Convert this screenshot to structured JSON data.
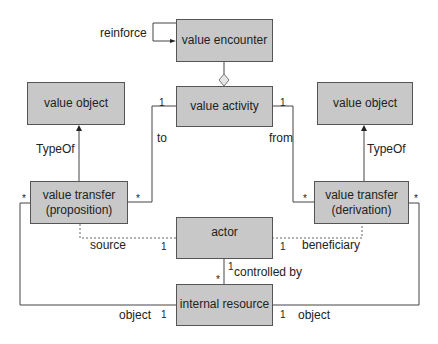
{
  "diagram": {
    "boxes": {
      "value_encounter": "value encounter",
      "value_activity": "value activity",
      "value_object_left": "value object",
      "value_object_right": "value object",
      "value_transfer_proposition_l1": "value transfer",
      "value_transfer_proposition_l2": "(proposition)",
      "value_transfer_derivation_l1": "value transfer",
      "value_transfer_derivation_l2": "(derivation)",
      "actor": "actor",
      "internal_resource": "internal resource"
    },
    "labels": {
      "reinforce": "reinforce",
      "to": "to",
      "from": "from",
      "typeof_left": "TypeOf",
      "typeof_right": "TypeOf",
      "source": "source",
      "beneficiary": "beneficiary",
      "controlled_by": "controlled by",
      "object_left": "object",
      "object_right": "object"
    },
    "multiplicities": {
      "activity_left": "1",
      "activity_right": "1",
      "proposition_left": "*",
      "proposition_right": "*",
      "derivation_left": "*",
      "derivation_right": "*",
      "actor_left": "1",
      "actor_right": "1",
      "actor_bottom": "1",
      "resource_top": "*",
      "resource_left": "1",
      "resource_right": "1"
    }
  }
}
